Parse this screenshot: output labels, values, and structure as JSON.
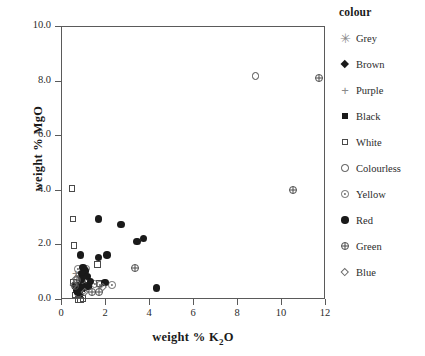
{
  "chart_data": {
    "type": "scatter",
    "title": "",
    "xlabel": "weight % K2O",
    "ylabel": "weight % MgO",
    "xlabel_parts": {
      "pre": "weight % K",
      "sub": "2",
      "post": "O"
    },
    "xlim": [
      0,
      12
    ],
    "ylim": [
      0,
      10
    ],
    "xticks": [
      0,
      2,
      4,
      6,
      8,
      10,
      12
    ],
    "xticklabels": [
      "0",
      "2",
      "4",
      "6",
      "8",
      "10",
      "12"
    ],
    "yticks": [
      0,
      2,
      4,
      6,
      8,
      10
    ],
    "yticklabels": [
      "0.0",
      "2.0",
      "4.0",
      "6.0",
      "8.0",
      "10.0"
    ],
    "grid": false,
    "legend_position": "right",
    "legend_title": "colour",
    "series": [
      {
        "name": "Grey",
        "marker": "asterisk",
        "color": "#8a8a8a",
        "points": []
      },
      {
        "name": "Brown",
        "marker": "filled-diamond",
        "color": "#1a1a1a",
        "points": [
          [
            0.78,
            0.72
          ],
          [
            0.92,
            0.86
          ]
        ]
      },
      {
        "name": "Purple",
        "marker": "plus",
        "color": "#8a8a8a",
        "points": [
          [
            0.7,
            1.12
          ],
          [
            0.88,
            1.05
          ]
        ]
      },
      {
        "name": "Black",
        "marker": "filled-square",
        "color": "#1a1a1a",
        "points": [
          [
            0.62,
            0.8
          ],
          [
            0.7,
            0.62
          ],
          [
            0.82,
            0.52
          ],
          [
            0.9,
            0.7
          ],
          [
            1.0,
            0.8
          ],
          [
            1.1,
            0.78
          ],
          [
            1.22,
            0.82
          ]
        ]
      },
      {
        "name": "White",
        "marker": "open-square",
        "color": "#4a4a4a",
        "points": [
          [
            0.45,
            4.35
          ],
          [
            0.5,
            3.25
          ],
          [
            0.55,
            2.27
          ],
          [
            1.62,
            1.58
          ],
          [
            0.52,
            0.92
          ],
          [
            0.6,
            0.45
          ],
          [
            0.72,
            0.3
          ],
          [
            0.84,
            0.28
          ],
          [
            0.95,
            0.33
          ],
          [
            1.68,
            0.88
          ]
        ]
      },
      {
        "name": "Colourless",
        "marker": "open-circle",
        "color": "#4a4a4a",
        "points": [
          [
            8.8,
            8.45
          ]
        ]
      },
      {
        "name": "Yellow",
        "marker": "dot-circle",
        "color": "#6a6a6a",
        "points": [
          [
            0.72,
            1.38
          ],
          [
            0.8,
            1.18
          ],
          [
            1.12,
            1.4
          ],
          [
            1.02,
            0.92
          ],
          [
            1.48,
            0.82
          ],
          [
            1.72,
            0.8
          ],
          [
            2.28,
            0.78
          ],
          [
            0.95,
            0.58
          ]
        ]
      },
      {
        "name": "Red",
        "marker": "filled-circle",
        "color": "#1a1a1a",
        "points": [
          [
            1.65,
            3.2
          ],
          [
            2.68,
            3.0
          ],
          [
            3.4,
            2.38
          ],
          [
            3.7,
            2.5
          ],
          [
            0.85,
            1.88
          ],
          [
            1.65,
            1.8
          ],
          [
            2.05,
            1.88
          ],
          [
            0.95,
            1.42
          ],
          [
            1.05,
            1.3
          ],
          [
            0.92,
            1.2
          ],
          [
            0.88,
            1.0
          ],
          [
            1.15,
            1.1
          ],
          [
            1.3,
            0.92
          ],
          [
            0.66,
            0.6
          ],
          [
            0.72,
            0.52
          ],
          [
            0.8,
            0.66
          ],
          [
            1.0,
            0.7
          ],
          [
            1.18,
            0.74
          ],
          [
            1.95,
            0.88
          ],
          [
            4.3,
            0.68
          ]
        ]
      },
      {
        "name": "Green",
        "marker": "plus-circle",
        "color": "#4a4a4a",
        "points": [
          [
            11.7,
            8.35
          ],
          [
            10.5,
            4.25
          ],
          [
            3.32,
            1.38
          ],
          [
            1.7,
            0.5
          ],
          [
            0.58,
            0.72
          ],
          [
            0.66,
            0.95
          ],
          [
            1.35,
            0.52
          ]
        ]
      },
      {
        "name": "Blue",
        "marker": "open-diamond",
        "color": "#6a6a6a",
        "points": [
          [
            1.85,
            0.78
          ],
          [
            0.62,
            1.08
          ],
          [
            0.55,
            0.88
          ],
          [
            1.05,
            0.62
          ]
        ]
      }
    ]
  }
}
